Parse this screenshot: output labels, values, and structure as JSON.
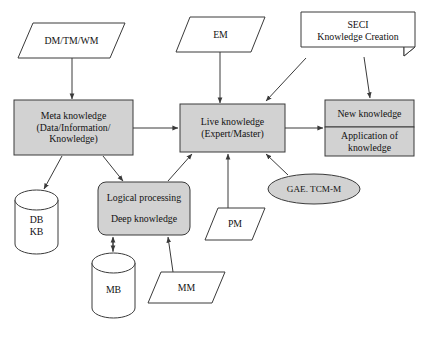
{
  "diagram": {
    "style": {
      "fill_gray": "#d2d2d2",
      "fill_white": "#ffffff",
      "stroke": "#3a3a3a",
      "text_color": "#111111",
      "background": "#ffffff"
    },
    "nodes": [
      {
        "id": "dm_tm_wm",
        "shape": "parallelogram",
        "fill": "white",
        "lines": [
          "DM/TM/WM"
        ],
        "x": 18,
        "y": 23,
        "w": 107,
        "h": 35
      },
      {
        "id": "em",
        "shape": "parallelogram",
        "fill": "white",
        "lines": [
          "EM"
        ],
        "x": 176,
        "y": 17,
        "w": 89,
        "h": 35
      },
      {
        "id": "seci",
        "shape": "document",
        "fill": "white",
        "lines": [
          "SECI",
          "Knowledge Creation"
        ],
        "x": 301,
        "y": 12,
        "w": 114,
        "h": 44
      },
      {
        "id": "meta_knowledge",
        "shape": "rect",
        "fill": "gray",
        "lines": [
          "Meta knowledge",
          "(Data/Information/",
          "Knowledge)"
        ],
        "x": 14,
        "y": 100,
        "w": 119,
        "h": 55
      },
      {
        "id": "live_knowledge",
        "shape": "rect",
        "fill": "gray",
        "lines": [
          "Live knowledge",
          "(Expert/Master)"
        ],
        "x": 180,
        "y": 104,
        "w": 105,
        "h": 48
      },
      {
        "id": "new_knowledge",
        "shape": "rect",
        "fill": "gray",
        "lines": [
          "New knowledge"
        ],
        "x": 325,
        "y": 100,
        "w": 89,
        "h": 27
      },
      {
        "id": "application_of_knowledge",
        "shape": "rect",
        "fill": "gray",
        "lines": [
          "Application of",
          "knowledge"
        ],
        "x": 325,
        "y": 127,
        "w": 89,
        "h": 29
      },
      {
        "id": "logical_processing",
        "shape": "rounded-rect",
        "fill": "gray",
        "lines": [
          "Logical processing",
          "",
          "Deep knowledge"
        ],
        "x": 98,
        "y": 182,
        "w": 92,
        "h": 53
      },
      {
        "id": "gae_tcm_m",
        "shape": "ellipse",
        "fill": "gray",
        "lines": [
          "GAE. TCM-M"
        ],
        "x": 268,
        "y": 174,
        "w": 92,
        "h": 30
      },
      {
        "id": "db_kb",
        "shape": "cylinder",
        "fill": "white",
        "lines": [
          "DB",
          "KB"
        ],
        "x": 15,
        "y": 190,
        "w": 43,
        "h": 64
      },
      {
        "id": "mb",
        "shape": "cylinder",
        "fill": "white",
        "lines": [
          "MB"
        ],
        "x": 92,
        "y": 253,
        "w": 43,
        "h": 65
      },
      {
        "id": "mm",
        "shape": "parallelogram",
        "fill": "white",
        "lines": [
          "MM"
        ],
        "x": 148,
        "y": 272,
        "w": 77,
        "h": 31
      },
      {
        "id": "pm",
        "shape": "parallelogram",
        "fill": "white",
        "lines": [
          "PM"
        ],
        "x": 205,
        "y": 208,
        "w": 60,
        "h": 32
      }
    ],
    "edges": [
      {
        "id": "dm-to-meta",
        "from": "dm_tm_wm",
        "to": "meta_knowledge"
      },
      {
        "id": "em-to-live",
        "from": "em",
        "to": "live_knowledge"
      },
      {
        "id": "seci-to-live",
        "from": "seci",
        "to": "live_knowledge"
      },
      {
        "id": "seci-to-new",
        "from": "seci",
        "to": "new_knowledge"
      },
      {
        "id": "meta-to-live",
        "from": "meta_knowledge",
        "to": "live_knowledge"
      },
      {
        "id": "live-to-new",
        "from": "live_knowledge",
        "to": "new_knowledge"
      },
      {
        "id": "meta-to-db",
        "from": "meta_knowledge",
        "to": "db_kb"
      },
      {
        "id": "meta-to-logical",
        "from": "meta_knowledge",
        "to": "logical_processing"
      },
      {
        "id": "logical-to-live",
        "from": "logical_processing",
        "to": "live_knowledge"
      },
      {
        "id": "logical-to-mb",
        "from": "logical_processing",
        "to": "mb"
      },
      {
        "id": "mb-to-logical",
        "from": "mb",
        "to": "logical_processing"
      },
      {
        "id": "mm-to-logical",
        "from": "mm",
        "to": "logical_processing"
      },
      {
        "id": "pm-to-live",
        "from": "pm",
        "to": "live_knowledge"
      },
      {
        "id": "gae-to-live",
        "from": "gae_tcm_m",
        "to": "live_knowledge"
      }
    ]
  }
}
